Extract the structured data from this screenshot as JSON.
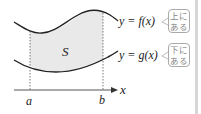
{
  "diagram": {
    "region_label": "S",
    "upper_curve_label": "y = f(x)",
    "lower_curve_label": "y = g(x)",
    "upper_note": [
      "上に",
      "ある"
    ],
    "lower_note": [
      "下に",
      "ある"
    ],
    "axis_label": "x",
    "left_bound": "a",
    "right_bound": "b",
    "colors": {
      "fill": "#e8e8e8",
      "curve": "#222222",
      "note": "#888888"
    }
  }
}
